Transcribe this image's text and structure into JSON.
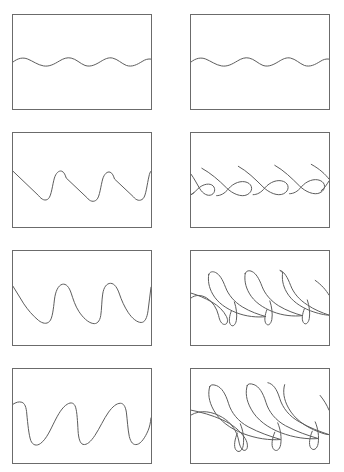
{
  "figure": {
    "title": "Wave steepening and overturning sequence",
    "layout": {
      "rows": 4,
      "columns": 2,
      "panel_count": 8,
      "panel_border_color": "#6b6b6b",
      "curve_color": "#5d5d5d",
      "background_color": "#ffffff",
      "panel_width_px": 140,
      "panel_height_px": 96
    },
    "columns": [
      {
        "id": "left",
        "label": "Surface profile"
      },
      {
        "id": "right",
        "label": "Overturning interface"
      }
    ],
    "panels": [
      {
        "id": "panel-1",
        "row": 1,
        "column": "left",
        "stage": "1",
        "label": "Small-amplitude sinusoidal wave",
        "wave_type": "sinusoid",
        "wavelength_count": 3.5,
        "amplitude_rel": 0.07,
        "overturned": false
      },
      {
        "id": "panel-2",
        "row": 1,
        "column": "right",
        "stage": "1",
        "label": "Small-amplitude sinusoidal wave",
        "wave_type": "sinusoid",
        "wavelength_count": 3.5,
        "amplitude_rel": 0.07,
        "overturned": false
      },
      {
        "id": "panel-3",
        "row": 2,
        "column": "left",
        "stage": "2",
        "label": "Steepened sawtooth profile",
        "wave_type": "sawtooth",
        "wavelength_count": 3.0,
        "amplitude_rel": 0.3,
        "overturned": false
      },
      {
        "id": "panel-4",
        "row": 2,
        "column": "right",
        "stage": "2",
        "label": "Interface begins to fold over",
        "wave_type": "folded-hook",
        "wavelength_count": 3.0,
        "amplitude_rel": 0.3,
        "overturned": true
      },
      {
        "id": "panel-5",
        "row": 3,
        "column": "left",
        "stage": "3",
        "label": "Deepened troughs with rounded crests",
        "wave_type": "sawtooth-rounded",
        "wavelength_count": 3.0,
        "amplitude_rel": 0.4,
        "overturned": false
      },
      {
        "id": "panel-6",
        "row": 3,
        "column": "right",
        "stage": "3",
        "label": "Plunging jets forming",
        "wave_type": "plunging-jet",
        "wavelength_count": 3.0,
        "amplitude_rel": 0.4,
        "overturned": true
      },
      {
        "id": "panel-7",
        "row": 4,
        "column": "left",
        "stage": "4",
        "label": "Near-vertical wave fronts",
        "wave_type": "vertical-front",
        "wavelength_count": 3.0,
        "amplitude_rel": 0.45,
        "overturned": false
      },
      {
        "id": "panel-8",
        "row": 4,
        "column": "right",
        "stage": "4",
        "label": "Fully developed plunging jets",
        "wave_type": "plunging-jet-long",
        "wavelength_count": 3.0,
        "amplitude_rel": 0.45,
        "overturned": true
      }
    ]
  }
}
